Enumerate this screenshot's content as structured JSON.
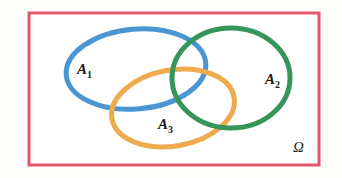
{
  "figure": {
    "kind": "venn-diagram",
    "background_color": "#fdfdfc"
  },
  "universe": {
    "name": "universe-rectangle",
    "label": "Ω",
    "label_icon_name": "omega-symbol",
    "border_color": "#e4576f",
    "fill_color": "#ffffff",
    "border_width": "3",
    "x": "29",
    "y": "13",
    "width": "290",
    "height": "152"
  },
  "sets": [
    {
      "id": "A1",
      "label_main": "A",
      "label_sub": "1",
      "color": "#4a96d2",
      "stroke_width": "5",
      "cx": "136",
      "cy": "69",
      "rx": "70",
      "ry": "40",
      "rotate": "-5",
      "label_x": "77",
      "label_y": "74"
    },
    {
      "id": "A2",
      "label_main": "A",
      "label_sub": "2",
      "color": "#35955a",
      "stroke_width": "5",
      "cx": "231",
      "cy": "78",
      "rx": "59",
      "ry": "50",
      "rotate": "0",
      "label_x": "265",
      "label_y": "84"
    },
    {
      "id": "A3",
      "label_main": "A",
      "label_sub": "3",
      "color": "#eeaa4d",
      "stroke_width": "5",
      "cx": "173",
      "cy": "108",
      "rx": "62",
      "ry": "38",
      "rotate": "-10",
      "label_x": "158",
      "label_y": "129"
    }
  ],
  "chart_data": {
    "type": "diagram",
    "title": "",
    "sets": [
      "A₁",
      "A₂",
      "A₃"
    ],
    "universe": "Ω",
    "relations": [
      "A₁ and A₂ overlap",
      "A₁ and A₃ overlap",
      "A₂ and A₃ overlap",
      "A₁, A₂ and A₃ share a common region"
    ],
    "colors": {
      "A₁": "#4a96d2",
      "A₂": "#35955a",
      "A₃": "#eeaa4d",
      "universe_border": "#e4576f"
    }
  }
}
